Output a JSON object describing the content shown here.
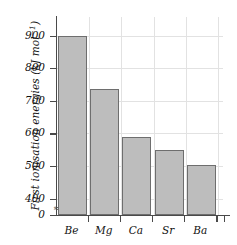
{
  "chart_data": {
    "type": "bar",
    "title": "",
    "xlabel": "",
    "ylabel": "First ionisation energies (kJ mol−1)",
    "ylabel_main": "First ionisation energies (kJ mol",
    "ylabel_sup": "−1",
    "ylabel_tail": ")",
    "categories": [
      "Be",
      "Mg",
      "Ca",
      "Sr",
      "Ba"
    ],
    "values": [
      900,
      736,
      590,
      549,
      503
    ],
    "ylim": [
      0,
      930
    ],
    "axis_break": true,
    "axis_break_marker": "≈",
    "ytick_labels": [
      "0",
      "400",
      "500",
      "600",
      "700",
      "800",
      "900"
    ],
    "ytick_values": [
      0,
      400,
      500,
      600,
      700,
      800,
      900
    ],
    "grid": true,
    "legend": "none",
    "colors": {
      "bar_fill": "#bdbdbd",
      "bar_edge": "#6e6e6e",
      "grid": "#e2e2e2",
      "axis": "#4a4a4a",
      "text": "#111111",
      "background": "#ffffff"
    }
  }
}
